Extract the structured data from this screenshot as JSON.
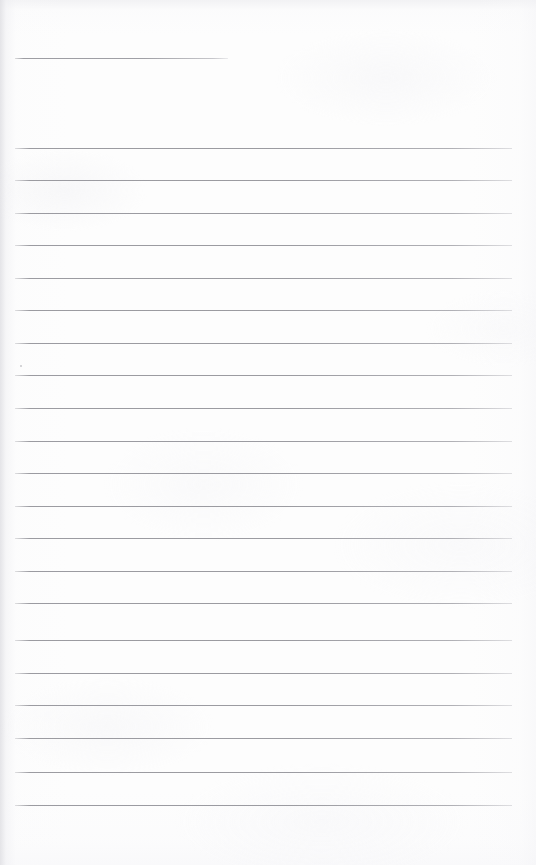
{
  "document": {
    "kind": "blank-lined-notebook-page",
    "orientation": "portrait",
    "page_width_px": 536,
    "page_height_px": 865,
    "written_content": "",
    "content_note": "No handwriting, printing, or text of any kind appears on the page.",
    "paper_color": "#fdfdfd",
    "rule_color": "#a9a9ae",
    "rule_thickness_px": 1
  },
  "heading_rule": {
    "label": "heading-rule",
    "y": 58,
    "x_start": 15,
    "x_end": 228,
    "length_px": 213,
    "written_value": ""
  },
  "ruled_lines": {
    "count": 21,
    "x_start": 15,
    "x_end": 512,
    "line_length_px": 497,
    "first_y": 148,
    "spacing_px": 32.5,
    "rows": [
      {
        "index": 1,
        "y": 148,
        "written_value": ""
      },
      {
        "index": 2,
        "y": 180,
        "written_value": ""
      },
      {
        "index": 3,
        "y": 213,
        "written_value": ""
      },
      {
        "index": 4,
        "y": 245,
        "written_value": ""
      },
      {
        "index": 5,
        "y": 278,
        "written_value": ""
      },
      {
        "index": 6,
        "y": 310,
        "written_value": ""
      },
      {
        "index": 7,
        "y": 343,
        "written_value": ""
      },
      {
        "index": 8,
        "y": 375,
        "written_value": ""
      },
      {
        "index": 9,
        "y": 408,
        "written_value": ""
      },
      {
        "index": 10,
        "y": 441,
        "written_value": ""
      },
      {
        "index": 11,
        "y": 473,
        "written_value": ""
      },
      {
        "index": 12,
        "y": 506,
        "written_value": ""
      },
      {
        "index": 13,
        "y": 538,
        "written_value": ""
      },
      {
        "index": 14,
        "y": 571,
        "written_value": ""
      },
      {
        "index": 15,
        "y": 603,
        "written_value": ""
      },
      {
        "index": 16,
        "y": 640,
        "written_value": ""
      },
      {
        "index": 17,
        "y": 673,
        "written_value": ""
      },
      {
        "index": 18,
        "y": 705,
        "written_value": ""
      },
      {
        "index": 19,
        "y": 738,
        "written_value": ""
      },
      {
        "index": 20,
        "y": 772,
        "written_value": ""
      },
      {
        "index": 21,
        "y": 805,
        "written_value": ""
      }
    ]
  },
  "artifacts": [
    {
      "name": "scan-speck",
      "x": 20,
      "y": 365
    }
  ]
}
